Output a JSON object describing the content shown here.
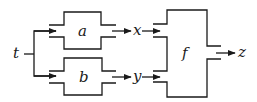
{
  "diagram": {
    "type": "block-diagram",
    "input": {
      "label": "t"
    },
    "blocks": [
      {
        "id": "a",
        "label": "a",
        "output": "x"
      },
      {
        "id": "b",
        "label": "b",
        "output": "y"
      },
      {
        "id": "f",
        "label": "f",
        "inputs": [
          "x",
          "y"
        ],
        "output": "z"
      }
    ],
    "signals": {
      "x": "x",
      "y": "y",
      "z": "z"
    },
    "colors": {
      "stroke": "#1a1a1a",
      "background": "#ffffff"
    }
  }
}
